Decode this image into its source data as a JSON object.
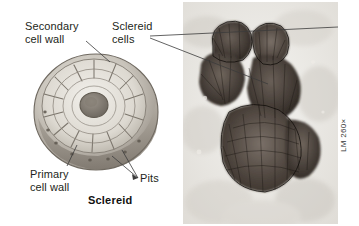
{
  "figure": {
    "background_color": "#ffffff",
    "text_color": "#231f20"
  },
  "labels": {
    "secondary_cell_wall": "Secondary\ncell wall",
    "sclereid_cells": "Sclereid\ncells",
    "primary_cell_wall": "Primary\ncell wall",
    "pits": "Pits"
  },
  "caption": {
    "diagram_caption": "Sclereid"
  },
  "micrograph": {
    "magnification": "LM 260×",
    "description": "Light micrograph of a cluster of thick-walled sclereid cells"
  },
  "illustration": {
    "description": "Cutaway drawing of a single sclereid showing layered secondary cell wall, central lumen, primary cell wall and pits",
    "colors": {
      "outer_wall": "#9a9289",
      "inner_wall": "#d9d5cd",
      "lumen": "#8d867d",
      "lamella_line": "#6f6a62"
    }
  }
}
